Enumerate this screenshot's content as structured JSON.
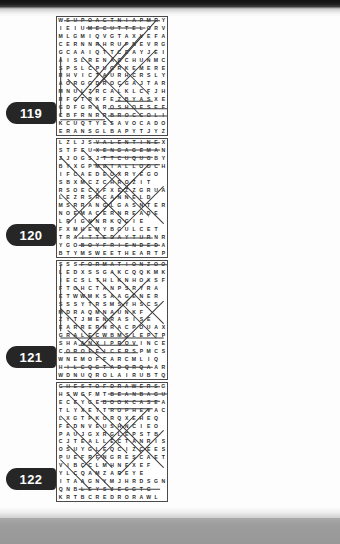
{
  "page": {
    "type": "word-search-puzzle-book-page",
    "grid_size": "15x15",
    "columns": 2,
    "rows": 4
  },
  "puzzles": [
    {
      "number": "119",
      "column": "left",
      "row": 0,
      "letters": [
        "WSUPOACTNIAPMRY",
        "IEIUMECUTTELORV",
        "MLGMIQVGTAXVEFA",
        "CERNNRHRUPNEVRG",
        "GCAAIQTTCEAYJEI",
        "AISLRENACCHUNMC",
        "SPSLCPUGRKEMERE",
        "RHVICTAURHCRSLY",
        "AORGGDROCGAJTAR",
        "MNULZRCALKLCFJH",
        "RFGTRKFEZBYASXEY",
        "GDFGRAROSHOESEF",
        "CBFRNRRBROCCOLI",
        "KCUQTYESAVOCADO",
        "ERANSGLBAPYTJYZ"
      ],
      "solutions": [
        {
          "x1": 1.0,
          "y1": 0.5,
          "x2": 14.0,
          "y2": 0.5
        },
        {
          "x1": 4.0,
          "y1": 1.5,
          "x2": 12.0,
          "y2": 1.5
        },
        {
          "x1": 8.0,
          "y1": 11.5,
          "x2": 13.0,
          "y2": 11.5
        },
        {
          "x1": 7.0,
          "y1": 12.5,
          "x2": 15.0,
          "y2": 12.5
        },
        {
          "x1": 7.0,
          "y1": 13.5,
          "x2": 15.0,
          "y2": 13.5
        },
        {
          "x1": 0.5,
          "y1": 14.0,
          "x2": 6.5,
          "y2": 14.0
        },
        {
          "x1": 13.5,
          "y1": 0.5,
          "x2": 5.5,
          "y2": 9.5
        },
        {
          "x1": 11.5,
          "y1": 2.5,
          "x2": 4.5,
          "y2": 10.5
        },
        {
          "x1": 9.5,
          "y1": 3.5,
          "x2": 2.5,
          "y2": 11.5
        },
        {
          "x1": 5.5,
          "y1": 3.5,
          "x2": 12.5,
          "y2": 10.5
        },
        {
          "x1": 3.5,
          "y1": 5.5,
          "x2": 11.5,
          "y2": 13.5
        },
        {
          "x1": 1.5,
          "y1": 8.5,
          "x2": 7.5,
          "y2": 14.5
        },
        {
          "x1": 0.5,
          "y1": 5.5,
          "x2": 0.5,
          "y2": 13.5
        },
        {
          "x1": 13.5,
          "y1": 4.5,
          "x2": 8.5,
          "y2": 9.5
        }
      ]
    },
    {
      "number": "120",
      "column": "left",
      "row": 1,
      "letters": [
        "LZLJSVALENTINEX",
        "STFEUXENGAGEMAN",
        "ZJOGSJTTCUQUGBY",
        "BYXGPMETALLOOCHC",
        "IFCAEDEOXRYEGO",
        "SBXMCZCHROZIT",
        "RSOECXFXEZZGRUA",
        "LEZRSRCANNELD",
        "MSRRANGLGASNTER",
        "NOEMACERNREADE",
        "LRIGNNRKQGIE",
        "FXMHEMYBGULCET",
        "TRAITTEDAYTURNR",
        "YGOBOYFRIENDEDA",
        "BTYMSWEETHEARTP"
      ],
      "solutions": [
        {
          "x1": 5.0,
          "y1": 0.5,
          "x2": 14.0,
          "y2": 0.5
        },
        {
          "x1": 5.0,
          "y1": 1.5,
          "x2": 14.0,
          "y2": 1.5
        },
        {
          "x1": 6.0,
          "y1": 2.5,
          "x2": 13.0,
          "y2": 2.5
        },
        {
          "x1": 5.0,
          "y1": 3.5,
          "x2": 14.0,
          "y2": 3.5
        },
        {
          "x1": 3.0,
          "y1": 13.5,
          "x2": 13.0,
          "y2": 13.5
        },
        {
          "x1": 3.0,
          "y1": 14.5,
          "x2": 14.0,
          "y2": 14.5
        },
        {
          "x1": 0.5,
          "y1": 2.5,
          "x2": 9.5,
          "y2": 11.5
        },
        {
          "x1": 3.5,
          "y1": 1.5,
          "x2": 12.5,
          "y2": 10.5
        },
        {
          "x1": 6.5,
          "y1": 3.5,
          "x2": 14.5,
          "y2": 11.5
        },
        {
          "x1": 12.5,
          "y1": 3.5,
          "x2": 4.5,
          "y2": 11.5
        },
        {
          "x1": 10.5,
          "y1": 5.5,
          "x2": 2.5,
          "y2": 13.5
        },
        {
          "x1": 8.5,
          "y1": 4.5,
          "x2": 1.5,
          "y2": 11.5
        },
        {
          "x1": 14.5,
          "y1": 6.5,
          "x2": 7.5,
          "y2": 13.5
        },
        {
          "x1": 0.5,
          "y1": 7.5,
          "x2": 6.5,
          "y2": 13.5
        }
      ]
    },
    {
      "number": "121",
      "column": "left",
      "row": 2,
      "letters": [
        "SSSFORMATIONZOO",
        "LEDXSSGAKCQQKMK",
        "IECSLTHLKNHOXSF",
        "FTOHCTANPSRYRA",
        "ETWWMKSAAGENER",
        "SSSYTRSMSYHSCS",
        "MDRAQMNAUNKF",
        "ZYTJMENRASISE",
        "EARRERNRACPOUAX",
        "GRALECWBMSLEPTP",
        "SHAANXIPROVINCE",
        "COROFFICERSPMCS",
        "WNEMOFFARCMLIQ",
        "HILCQGTADQRQAAR",
        "WDNUQROLAIRUBTQ"
      ],
      "solutions": [
        {
          "x1": 3.0,
          "y1": 0.5,
          "x2": 15.0,
          "y2": 0.5
        },
        {
          "x1": 0.5,
          "y1": 10.5,
          "x2": 14.5,
          "y2": 10.5
        },
        {
          "x1": 3.0,
          "y1": 11.5,
          "x2": 11.0,
          "y2": 11.5
        },
        {
          "x1": 1.0,
          "y1": 12.5,
          "x2": 11.0,
          "y2": 12.5
        },
        {
          "x1": 1.0,
          "y1": 14.5,
          "x2": 13.0,
          "y2": 14.5
        },
        {
          "x1": 7.5,
          "y1": 1.5,
          "x2": 14.5,
          "y2": 8.5
        },
        {
          "x1": 5.5,
          "y1": 2.5,
          "x2": 13.5,
          "y2": 10.5
        },
        {
          "x1": 12.5,
          "y1": 2.5,
          "x2": 4.5,
          "y2": 10.5
        },
        {
          "x1": 10.5,
          "y1": 4.5,
          "x2": 3.5,
          "y2": 11.5
        },
        {
          "x1": 2.5,
          "y1": 3.5,
          "x2": 9.5,
          "y2": 10.5
        },
        {
          "x1": 0.5,
          "y1": 6.5,
          "x2": 6.5,
          "y2": 12.5
        },
        {
          "x1": 14.5,
          "y1": 5.5,
          "x2": 8.5,
          "y2": 11.5
        },
        {
          "x1": 0.5,
          "y1": 0.5,
          "x2": 0.5,
          "y2": 9.5
        },
        {
          "x1": 1.5,
          "y1": 9.5,
          "x2": 7.5,
          "y2": 14.5
        }
      ]
    },
    {
      "number": "122",
      "column": "left",
      "row": 3,
      "letters": [
        "CHESTOFDRAWERSG",
        "HSWGFMTBEANBAGU",
        "ECEYGEBOOKCASEA",
        "TLYXETTROPHEVAC",
        "LXGTPKORQXEHEQ",
        "FEDNVEUSHNCIEO",
        "PAUJGXRGLEPSTB",
        "CJTEALLECTANRIS",
        "OSUYGLEQCIZCEES",
        "PUEFRFNGRESCAET",
        "VIBCCLMHNEXEF",
        "YLCQAMZAREYE",
        "ITAAGNYMJHRDSGN",
        "QNBLEYSJECGTG",
        "KRTBCREDRORAWL"
      ],
      "solutions": [
        {
          "x1": 0.5,
          "y1": 0.5,
          "x2": 14.0,
          "y2": 0.5
        },
        {
          "x1": 7.0,
          "y1": 1.5,
          "x2": 15.0,
          "y2": 1.5
        },
        {
          "x1": 6.0,
          "y1": 2.5,
          "x2": 14.0,
          "y2": 2.5
        },
        {
          "x1": 7.0,
          "y1": 3.5,
          "x2": 13.0,
          "y2": 3.5
        },
        {
          "x1": 3.0,
          "y1": 14.5,
          "x2": 14.0,
          "y2": 14.5
        },
        {
          "x1": 1.5,
          "y1": 1.5,
          "x2": 9.5,
          "y2": 9.5
        },
        {
          "x1": 3.5,
          "y1": 1.5,
          "x2": 11.5,
          "y2": 9.5
        },
        {
          "x1": 12.5,
          "y1": 3.5,
          "x2": 5.5,
          "y2": 10.5
        },
        {
          "x1": 10.5,
          "y1": 4.5,
          "x2": 3.5,
          "y2": 11.5
        },
        {
          "x1": 0.5,
          "y1": 4.5,
          "x2": 7.5,
          "y2": 11.5
        },
        {
          "x1": 8.5,
          "y1": 5.5,
          "x2": 14.5,
          "y2": 11.5
        },
        {
          "x1": 1.5,
          "y1": 8.5,
          "x2": 7.5,
          "y2": 14.5
        },
        {
          "x1": 14.5,
          "y1": 6.5,
          "x2": 8.5,
          "y2": 12.5
        },
        {
          "x1": 0.5,
          "y1": 10.5,
          "x2": 4.5,
          "y2": 14.5
        }
      ]
    },
    {
      "number": "123",
      "column": "right",
      "row": 0,
      "letters": [
        "UBARUHBBGGFFMEC",
        "LZRKANPIGHLRIBL",
        "VNIGAGGUEIFDGI",
        "EWGEMAYJCLNIAM",
        "SNUQRCNBOTERA",
        "ANETASYREYETT",
        "EOTERRBRELAALE",
        "SGGENAYACATLBC",
        "IGTFMARWHRPAR",
        "DIIQQAHLNEEACHA",
        "LHMJMTMCKNKQJCN",
        "HTACDKOALBCJRPE",
        "ERUTCETIHCRASXE",
        "ISLAMICSCHOLARS",
        "UCHRISTIANITYUL"
      ],
      "solutions": [
        {
          "x1": 0.5,
          "y1": 12.5,
          "x2": 13.5,
          "y2": 12.5
        },
        {
          "x1": 0.5,
          "y1": 13.5,
          "x2": 14.0,
          "y2": 13.5
        },
        {
          "x1": 1.0,
          "y1": 14.5,
          "x2": 13.0,
          "y2": 14.5
        },
        {
          "x1": 0.5,
          "y1": 11.5,
          "x2": 9.5,
          "y2": 11.5
        },
        {
          "x1": 1.5,
          "y1": 0.5,
          "x2": 10.5,
          "y2": 9.5
        },
        {
          "x1": 5.5,
          "y1": 1.5,
          "x2": 13.5,
          "y2": 9.5
        },
        {
          "x1": 12.5,
          "y1": 1.5,
          "x2": 4.5,
          "y2": 9.5
        },
        {
          "x1": 10.5,
          "y1": 3.5,
          "x2": 3.5,
          "y2": 10.5
        },
        {
          "x1": 3.5,
          "y1": 3.5,
          "x2": 10.5,
          "y2": 10.5
        },
        {
          "x1": 0.5,
          "y1": 5.5,
          "x2": 6.5,
          "y2": 11.5
        },
        {
          "x1": 14.5,
          "y1": 4.5,
          "x2": 7.5,
          "y2": 11.5
        },
        {
          "x1": 0.5,
          "y1": 2.5,
          "x2": 0.5,
          "y2": 10.5
        },
        {
          "x1": 8.5,
          "y1": 0.5,
          "x2": 14.5,
          "y2": 6.5
        },
        {
          "x1": 13.5,
          "y1": 7.5,
          "x2": 9.5,
          "y2": 11.5
        }
      ]
    },
    {
      "number": "124",
      "column": "right",
      "row": 1,
      "letters": [
        "MEMRNUNKREPKHPL",
        "MASRLATRHEQQALI",
        "TNKWWRCYQQQJNA",
        "ACQRDZNPLCFSY",
        "GAKNSAMRDQE",
        "FFEGERIGLKSAN",
        "QLKLRNQQRBNDQ",
        "EFARRRRAULREST",
        "FHWZENRTSWAM",
        "DMENHEZNYNSY",
        "WAMQBTCHYZAPDF",
        "GAMSRPOEMRRCVN",
        "HMXQPARDONERAU",
        "UJSHNOITFURROC",
        "CANONYEOMANPIB"
      ],
      "solutions": [
        {
          "x1": 4.0,
          "y1": 11.5,
          "x2": 8.0,
          "y2": 11.5
        },
        {
          "x1": 3.0,
          "y1": 12.5,
          "x2": 11.0,
          "y2": 12.5
        },
        {
          "x1": 2.0,
          "y1": 13.5,
          "x2": 14.0,
          "y2": 13.5
        },
        {
          "x1": 0.5,
          "y1": 14.5,
          "x2": 11.0,
          "y2": 14.5
        },
        {
          "x1": 2.5,
          "y1": 0.5,
          "x2": 11.5,
          "y2": 9.5
        },
        {
          "x1": 6.5,
          "y1": 0.5,
          "x2": 14.5,
          "y2": 8.5
        },
        {
          "x1": 12.5,
          "y1": 0.5,
          "x2": 4.5,
          "y2": 8.5
        },
        {
          "x1": 10.5,
          "y1": 2.5,
          "x2": 3.5,
          "y2": 9.5
        },
        {
          "x1": 8.5,
          "y1": 3.5,
          "x2": 1.5,
          "y2": 10.5
        },
        {
          "x1": 0.5,
          "y1": 3.5,
          "x2": 7.5,
          "y2": 10.5
        },
        {
          "x1": 14.5,
          "y1": 5.5,
          "x2": 8.5,
          "y2": 11.5
        },
        {
          "x1": 0.5,
          "y1": 7.5,
          "x2": 6.5,
          "y2": 13.5
        },
        {
          "x1": 0.5,
          "y1": 0.5,
          "x2": 0.5,
          "y2": 9.5
        },
        {
          "x1": 13.5,
          "y1": 9.5,
          "x2": 9.5,
          "y2": 13.5
        }
      ]
    },
    {
      "number": "125",
      "column": "right",
      "row": 2,
      "letters": [
        "FORWOODBLOCKLRL",
        "RDBUNOITCUDEQQK",
        "AKQCTDVZMRBYAL",
        "WRETALUPINAMIC",
        "AEATYIXFEEXE",
        "TNFRQTFNELPQ",
        "RHNMABIRNTEAS",
        "ESQGENAGAKQYTS",
        "FRAVNFAMHTSZATW",
        "YSAQFCRAQWBEQ",
        "LSIREGQLWQBBG",
        "REYEDMECNINRBB",
        "FCRRFTHKBSESS",
        "LATERALTHINKING",
        "LANAGRAMSBNHT"
      ],
      "solutions": [
        {
          "x1": 3.0,
          "y1": 0.5,
          "x2": 12.0,
          "y2": 0.5
        },
        {
          "x1": 3.0,
          "y1": 1.5,
          "x2": 13.0,
          "y2": 1.5
        },
        {
          "x1": 1.0,
          "y1": 3.5,
          "x2": 13.0,
          "y2": 3.5
        },
        {
          "x1": 0.5,
          "y1": 13.5,
          "x2": 14.5,
          "y2": 13.5
        },
        {
          "x1": 1.0,
          "y1": 14.5,
          "x2": 9.5,
          "y2": 14.5
        },
        {
          "x1": 0.5,
          "y1": 1.5,
          "x2": 9.5,
          "y2": 10.5
        },
        {
          "x1": 4.5,
          "y1": 2.5,
          "x2": 12.5,
          "y2": 10.5
        },
        {
          "x1": 12.5,
          "y1": 2.5,
          "x2": 4.5,
          "y2": 10.5
        },
        {
          "x1": 10.5,
          "y1": 4.5,
          "x2": 3.5,
          "y2": 11.5
        },
        {
          "x1": 2.5,
          "y1": 4.5,
          "x2": 9.5,
          "y2": 11.5
        },
        {
          "x1": 14.5,
          "y1": 3.5,
          "x2": 7.5,
          "y2": 10.5
        },
        {
          "x1": 0.5,
          "y1": 6.5,
          "x2": 6.5,
          "y2": 12.5
        },
        {
          "x1": 14.5,
          "y1": 6.5,
          "x2": 9.5,
          "y2": 11.5
        },
        {
          "x1": 12.5,
          "y1": 8.5,
          "x2": 8.5,
          "y2": 12.5
        }
      ]
    },
    {
      "number": "126",
      "column": "right",
      "row": 3,
      "letters": [
        "PKPRIMEMINISTER",
        "GBRMPTNEDISERPF",
        "ZRRECORONATIONG",
        "VYEJTARCOTUAR",
        "DEKNGYEDMBUJG",
        "FEADARNSCHCYB",
        "SURIJMYCNTQRA",
        "QDVSJKLHSEQJI",
        "TDAILJESTMVYR",
        "NSLABCDRYTGSZEA",
        "MARISERHFZLEA",
        "ERXRSTHEXTVRTEV",
        "SGBPAMEYJEEUS",
        "BGHMVXLHXTHRONE",
        "FRENFRCMYTSANYD"
      ],
      "solutions": [
        {
          "x1": 2.0,
          "y1": 0.5,
          "x2": 15.0,
          "y2": 0.5
        },
        {
          "x1": 4.0,
          "y1": 1.5,
          "x2": 14.0,
          "y2": 1.5
        },
        {
          "x1": 4.0,
          "y1": 2.5,
          "x2": 14.0,
          "y2": 2.5
        },
        {
          "x1": 4.0,
          "y1": 3.5,
          "x2": 13.0,
          "y2": 3.5
        },
        {
          "x1": 10.0,
          "y1": 13.5,
          "x2": 15.0,
          "y2": 13.5
        },
        {
          "x1": 6.0,
          "y1": 14.5,
          "x2": 14.0,
          "y2": 14.5
        },
        {
          "x1": 0.5,
          "y1": 0.5,
          "x2": 9.5,
          "y2": 9.5
        },
        {
          "x1": 4.5,
          "y1": 1.5,
          "x2": 13.5,
          "y2": 10.5
        },
        {
          "x1": 13.5,
          "y1": 2.5,
          "x2": 5.5,
          "y2": 10.5
        },
        {
          "x1": 11.5,
          "y1": 4.5,
          "x2": 4.5,
          "y2": 11.5
        },
        {
          "x1": 2.5,
          "y1": 3.5,
          "x2": 10.5,
          "y2": 11.5
        },
        {
          "x1": 0.5,
          "y1": 6.5,
          "x2": 7.5,
          "y2": 13.5
        },
        {
          "x1": 14.5,
          "y1": 5.5,
          "x2": 8.5,
          "y2": 11.5
        },
        {
          "x1": 1.5,
          "y1": 9.5,
          "x2": 7.5,
          "y2": 14.5
        }
      ]
    }
  ]
}
